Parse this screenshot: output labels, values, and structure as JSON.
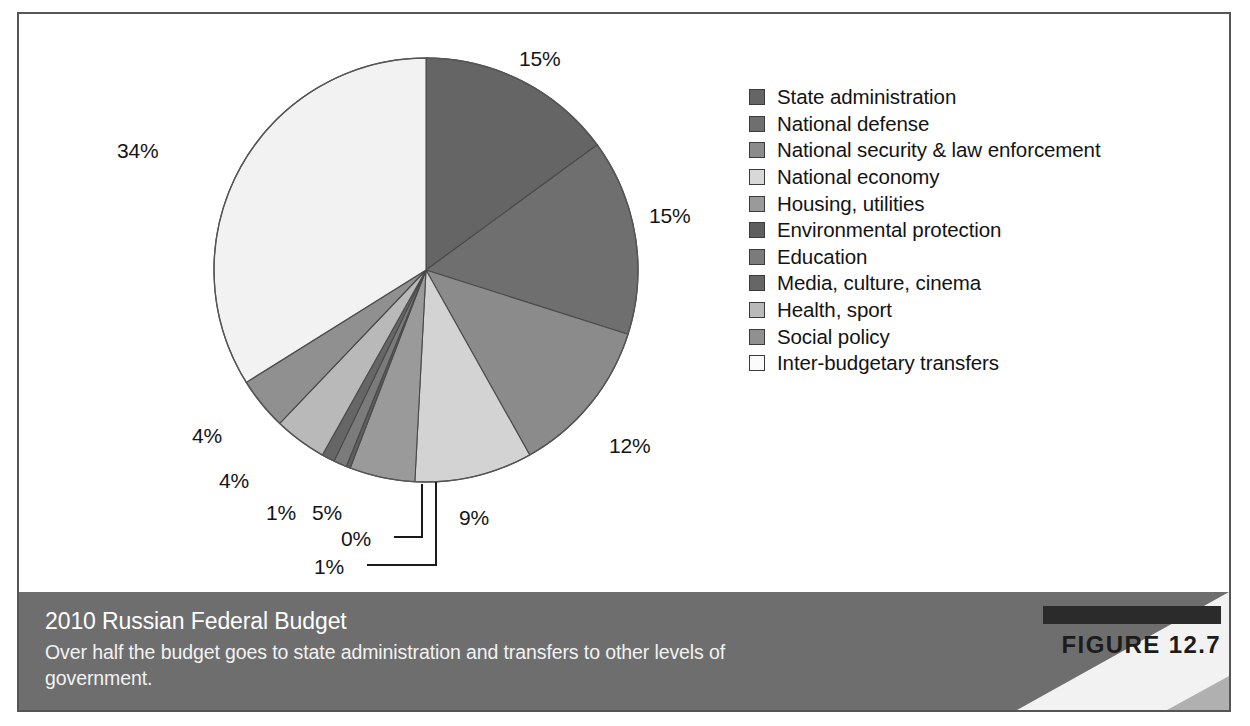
{
  "figure": {
    "badge_label": "FIGURE 12.7",
    "title": "2010 Russian Federal Budget",
    "caption": "Over half the budget goes to state administration and transfers to other levels of government."
  },
  "colors": {
    "frame_border": "#555555",
    "background": "#ffffff",
    "footer_band": "#6e6e6e",
    "footer_wedge": "#f0f0f0",
    "badge_bar": "#2b2b2b",
    "label_text": "#141414",
    "slice_outline": "#4a4a4a"
  },
  "chart_data": {
    "type": "pie",
    "title": "2010 Russian Federal Budget",
    "subtitle": "Over half the budget goes to state administration and transfers to other levels of government.",
    "legend_position": "right",
    "start_angle_deg": 0,
    "direction": "clockwise",
    "categories": [
      "State administration",
      "National defense",
      "National security & law enforcement",
      "National economy",
      "Housing, utilities",
      "Environmental protection",
      "Education",
      "Media, culture, cinema",
      "Health, sport",
      "Social policy",
      "Inter-budgetary transfers"
    ],
    "values": [
      15,
      15,
      12,
      9,
      5,
      0,
      1,
      1,
      4,
      4,
      34
    ],
    "value_labels": [
      "15%",
      "15%",
      "12%",
      "9%",
      "5%",
      "0%",
      "1%",
      "1%",
      "4%",
      "4%",
      "34%"
    ],
    "colors": [
      "#656565",
      "#6f6f6f",
      "#8b8b8b",
      "#d3d3d3",
      "#9a9a9a",
      "#5e5e5e",
      "#7b7b7b",
      "#666666",
      "#b9b9b9",
      "#909090",
      "#f2f2f2"
    ],
    "units": "percent of federal budget",
    "total": 100
  },
  "labels": {
    "slice_0": "15%",
    "slice_1": "15%",
    "slice_2": "12%",
    "slice_3": "9%",
    "slice_4": "5%",
    "slice_5": "0%",
    "slice_6": "1%",
    "slice_7": "1%",
    "slice_8": "4%",
    "slice_9": "4%",
    "slice_10": "34%"
  },
  "legend": {
    "items": [
      {
        "label": "State administration",
        "color": "#656565"
      },
      {
        "label": "National defense",
        "color": "#6f6f6f"
      },
      {
        "label": "National security & law enforcement",
        "color": "#8b8b8b"
      },
      {
        "label": "National economy",
        "color": "#d8d8d8"
      },
      {
        "label": "Housing, utilities",
        "color": "#9a9a9a"
      },
      {
        "label": "Environmental protection",
        "color": "#5e5e5e"
      },
      {
        "label": "Education",
        "color": "#7b7b7b"
      },
      {
        "label": "Media, culture, cinema",
        "color": "#666666"
      },
      {
        "label": "Health, sport",
        "color": "#b9b9b9"
      },
      {
        "label": "Social policy",
        "color": "#909090"
      },
      {
        "label": "Inter-budgetary transfers",
        "color": "#fbfbfb"
      }
    ]
  }
}
